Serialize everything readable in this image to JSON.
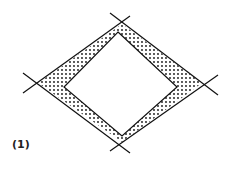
{
  "figure": {
    "label": "(1)"
  }
}
